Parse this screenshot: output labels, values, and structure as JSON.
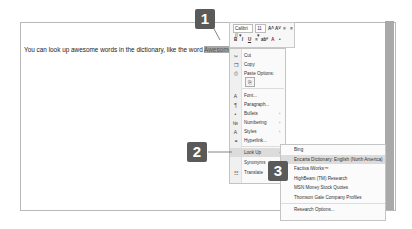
{
  "document": {
    "text_before": "You can look up awesome words in the dictionary, like the word ",
    "selected_word": "Awesome",
    "text_after": ". For example."
  },
  "mini_toolbar": {
    "font_name": "Calibri (I",
    "font_size": "11",
    "row1_icons": [
      "grow-font",
      "shrink-font",
      "format-painter-a",
      "format-painter-b"
    ],
    "row1_glyphs": [
      "A˄",
      "A˅",
      "≡",
      "≡"
    ],
    "row2_glyphs": [
      "B",
      "I",
      "U",
      "≡",
      "abⱽ",
      "A",
      "•"
    ]
  },
  "context_menu": {
    "items": [
      {
        "label": "Cut",
        "icon": "✂",
        "arrow": ""
      },
      {
        "label": "Copy",
        "icon": "❐",
        "arrow": ""
      },
      {
        "label": "Paste Options:",
        "icon": "⎙",
        "arrow": ""
      },
      {
        "label": "Font...",
        "icon": "A",
        "arrow": ""
      },
      {
        "label": "Paragraph...",
        "icon": "¶",
        "arrow": ""
      },
      {
        "label": "Bullets",
        "icon": "•",
        "arrow": "›"
      },
      {
        "label": "Numbering",
        "icon": "№",
        "arrow": "›"
      },
      {
        "label": "Styles",
        "icon": "A",
        "arrow": "›"
      },
      {
        "label": "Hyperlink...",
        "icon": "⚭",
        "arrow": ""
      },
      {
        "label": "Look Up",
        "icon": "",
        "arrow": "›"
      },
      {
        "label": "Synonyms",
        "icon": "",
        "arrow": "›"
      },
      {
        "label": "Translate",
        "icon": "☷",
        "arrow": ""
      }
    ],
    "paste_option_icon": "⎘"
  },
  "submenu": {
    "items": [
      "Bing",
      "Encarta Dictionary: English (North America)",
      "Factiva iWorks™",
      "HighBeam (TM) Research",
      "MSN Money Stock Quotes",
      "Thomson Gale Company Profiles"
    ],
    "footer": "Research Options..."
  },
  "callouts": [
    "1",
    "2",
    "3"
  ]
}
